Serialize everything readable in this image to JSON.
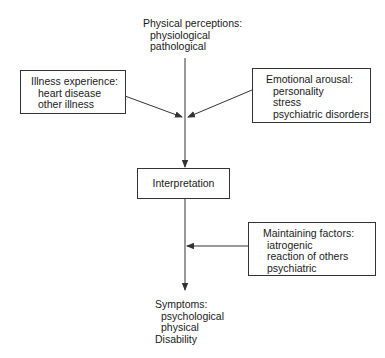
{
  "diagram": {
    "top_node": {
      "title": "Physical perceptions:",
      "items": [
        "physiological",
        "pathological"
      ]
    },
    "left_node": {
      "title": "Illness experience:",
      "items": [
        "heart disease",
        "other illness"
      ]
    },
    "right_node": {
      "title": "Emotional arousal:",
      "items": [
        "personality",
        "stress",
        "psychiatric disorders"
      ]
    },
    "center_node": {
      "title": "Interpretation"
    },
    "maintaining_node": {
      "title": "Maintaining factors:",
      "items": [
        "iatrogenic",
        "reaction of others",
        "psychiatric"
      ]
    },
    "bottom_node": {
      "title": "Symptoms:",
      "items": [
        "psychological",
        "physical"
      ],
      "footer": "Disability"
    },
    "colors": {
      "line": "#333333",
      "text": "#1a1a1a",
      "background": "#ffffff"
    }
  }
}
